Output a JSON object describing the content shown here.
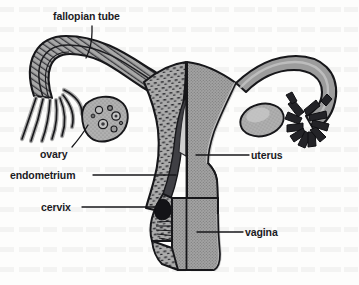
{
  "figure": {
    "type": "anatomical-line-diagram",
    "background_color": "#fdfdfc",
    "ink_color": "#1b1b1f",
    "fill_gray": "#9a9a9a",
    "fill_gray_light": "#b4b4b4",
    "fill_gray_dark": "#6e6e6e"
  },
  "labels": {
    "fallopian_tube": "fallopian tube",
    "ovary": "ovary",
    "endometrium": "endometrium",
    "cervix": "cervix",
    "uterus": "uterus",
    "vagina": "vagina"
  },
  "structures": [
    {
      "name": "fallopian-tube-left",
      "side": "left",
      "rendering": "cut-away-hatched"
    },
    {
      "name": "fimbriae-left",
      "side": "left",
      "rendering": "curved-finger-strands"
    },
    {
      "name": "ovary-left",
      "side": "left",
      "rendering": "cut-away-with-follicles"
    },
    {
      "name": "uterus-body",
      "side": "center",
      "rendering": "half-section"
    },
    {
      "name": "endometrium-lining",
      "side": "left",
      "rendering": "stippled-band"
    },
    {
      "name": "cervix",
      "side": "center",
      "rendering": "dark-os-opening"
    },
    {
      "name": "vagina",
      "side": "center",
      "rendering": "solid-gray-canal"
    },
    {
      "name": "fallopian-tube-right",
      "side": "right",
      "rendering": "solid-gray"
    },
    {
      "name": "fimbriae-right",
      "side": "right",
      "rendering": "dark-blocky-fingers"
    },
    {
      "name": "ovary-right",
      "side": "right",
      "rendering": "solid-gray-oval"
    }
  ]
}
